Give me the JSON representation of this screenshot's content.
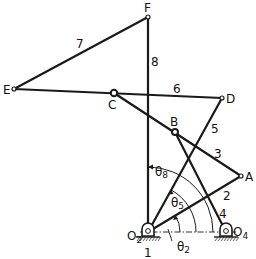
{
  "diagram": {
    "type": "eight-bar linkage mechanism",
    "points": {
      "F": {
        "label": "F",
        "x": 148,
        "y": 17
      },
      "E": {
        "label": "E",
        "x": 14,
        "y": 89
      },
      "C": {
        "label": "C",
        "x": 114,
        "y": 93
      },
      "D": {
        "label": "D",
        "x": 222,
        "y": 98
      },
      "B": {
        "label": "B",
        "x": 175,
        "y": 132
      },
      "A": {
        "label": "A",
        "x": 241,
        "y": 176
      },
      "O2": {
        "label": "O",
        "sub": "2",
        "x": 148,
        "y": 232
      },
      "O4": {
        "label": "O",
        "sub": "4",
        "x": 226,
        "y": 232
      }
    },
    "links": [
      {
        "id": "1",
        "label": "1",
        "from": "O2",
        "to": "O4",
        "note": "ground"
      },
      {
        "id": "2",
        "label": "2",
        "from": "O2",
        "to": "A"
      },
      {
        "id": "3",
        "label": "3",
        "from": "A",
        "to": "C"
      },
      {
        "id": "4",
        "label": "4",
        "from": "O4",
        "to": "B"
      },
      {
        "id": "5",
        "label": "5",
        "from": "O2",
        "to": "D"
      },
      {
        "id": "6",
        "label": "6",
        "from": "E",
        "to": "D"
      },
      {
        "id": "7",
        "label": "7",
        "from": "E",
        "to": "F"
      },
      {
        "id": "8",
        "label": "8",
        "from": "O2",
        "to": "F"
      }
    ],
    "angles": [
      {
        "name": "theta2",
        "symbol": "θ",
        "sub": "2",
        "ref": "link 2"
      },
      {
        "name": "theta5",
        "symbol": "θ",
        "sub": "5",
        "ref": "link 5"
      },
      {
        "name": "theta8",
        "symbol": "θ",
        "sub": "8",
        "ref": "link 8"
      }
    ]
  }
}
